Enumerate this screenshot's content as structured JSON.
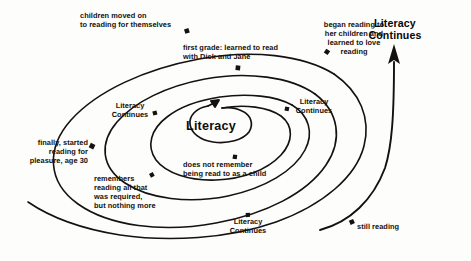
{
  "diagram": {
    "type": "spiral-timeline",
    "title_visible": false,
    "core_label": "Literacy",
    "outcome_label": "Literacy\nContinues",
    "ink_color": "#141110",
    "paper_color": "#fdfdfc",
    "annotations": [
      {
        "id": "children-moved-on",
        "text": "children moved on\nto reading for themselves",
        "align": "left",
        "marker": {
          "x": 187,
          "y": 31
        }
      },
      {
        "id": "first-grade",
        "text": "first grade: learned to read\nwith Dick and Jane",
        "align": "left",
        "marker": {
          "x": 238,
          "y": 68
        }
      },
      {
        "id": "began-reading-to-children",
        "text": "began reading to\nher children and\nlearned to love\nreading",
        "align": "center",
        "marker": {
          "x": 327,
          "y": 52
        }
      },
      {
        "id": "literacy-continues-left",
        "text": "Literacy\nContinues",
        "align": "center",
        "marker": {
          "x": 155,
          "y": 113
        }
      },
      {
        "id": "literacy-continues-right",
        "text": "Literacy\nContinues",
        "align": "center",
        "marker": {
          "x": 287,
          "y": 109
        }
      },
      {
        "id": "finally-started-reading",
        "text": "finally, started\nreading for\npleasure, age 30",
        "align": "right",
        "marker": {
          "x": 92,
          "y": 146
        }
      },
      {
        "id": "remembers-reading",
        "text": "remembers\nreading all that\nwas required,\nbut nothing more",
        "align": "left",
        "marker": {
          "x": 152,
          "y": 175
        }
      },
      {
        "id": "does-not-remember",
        "text": "does not remember\nbeing read to as a child",
        "align": "left",
        "marker": {
          "x": 235,
          "y": 157
        }
      },
      {
        "id": "literacy-continues-bottom",
        "text": "Literacy\nContinues",
        "align": "center",
        "marker": {
          "x": 248,
          "y": 215
        }
      },
      {
        "id": "still-reading",
        "text": "still reading",
        "align": "left",
        "marker": {
          "x": 352,
          "y": 222
        }
      }
    ]
  }
}
